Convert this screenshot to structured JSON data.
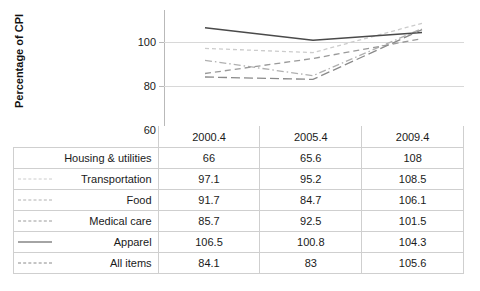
{
  "chart_data": {
    "type": "line",
    "title": "",
    "xlabel": "",
    "ylabel": "Percentage of CPI",
    "categories": [
      "2000.4",
      "2005.4",
      "2009.4"
    ],
    "ylim": [
      60,
      110
    ],
    "yticks": [
      60,
      80,
      100
    ],
    "grid": true,
    "legend_position": "table-left-column",
    "series": [
      {
        "name": "Housing & utilities",
        "values": [
          66,
          65.6,
          108
        ],
        "style": "none",
        "color": "#808080"
      },
      {
        "name": "Transportation",
        "values": [
          97.1,
          95.2,
          108.5
        ],
        "style": "dotted-fine",
        "color": "#cccccc"
      },
      {
        "name": "Food",
        "values": [
          91.7,
          84.7,
          106.1
        ],
        "style": "dashdot",
        "color": "#b0b0b0"
      },
      {
        "name": "Medical care",
        "values": [
          85.7,
          92.5,
          101.5
        ],
        "style": "dashed",
        "color": "#9a9a9a"
      },
      {
        "name": "Apparel",
        "values": [
          106.5,
          100.8,
          104.3
        ],
        "style": "solid",
        "color": "#4a4a4a"
      },
      {
        "name": "All items",
        "values": [
          84.1,
          83,
          105.6
        ],
        "style": "longdash",
        "color": "#8a8a8a"
      }
    ]
  },
  "axis": {
    "y_title": "Percentage of CPI",
    "y_ticks": [
      "100",
      "80",
      "60"
    ]
  },
  "table": {
    "header_blank": "",
    "columns": [
      "2000.4",
      "2005.4",
      "2009.4"
    ],
    "rows": [
      {
        "label": "Housing & utilities",
        "v0": "66",
        "v1": "65.6",
        "v2": "108"
      },
      {
        "label": "Transportation",
        "v0": "97.1",
        "v1": "95.2",
        "v2": "108.5"
      },
      {
        "label": "Food",
        "v0": "91.7",
        "v1": "84.7",
        "v2": "106.1"
      },
      {
        "label": "Medical care",
        "v0": "85.7",
        "v1": "92.5",
        "v2": "101.5"
      },
      {
        "label": "Apparel",
        "v0": "106.5",
        "v1": "100.8",
        "v2": "104.3"
      },
      {
        "label": "All items",
        "v0": "84.1",
        "v1": "83",
        "v2": "105.6"
      }
    ]
  },
  "colors": {
    "gridline": "#d8d8d8",
    "axis": "#b9b9b9",
    "border": "#cfcfcf",
    "text": "#1a1a1a"
  }
}
